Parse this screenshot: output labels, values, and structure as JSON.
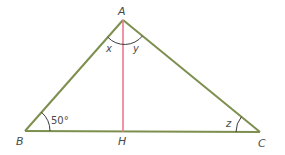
{
  "diagram": {
    "type": "triangle-with-altitude",
    "colors": {
      "triangle": "#7d8f4e",
      "altitude": "#e87a8c",
      "arc": "#3c3c3c",
      "label": "#4a4a4a"
    },
    "vertices": {
      "A": {
        "label": "A",
        "x": 123,
        "y": 20
      },
      "B": {
        "label": "B",
        "x": 25,
        "y": 131
      },
      "C": {
        "label": "C",
        "x": 260,
        "y": 132
      },
      "H": {
        "label": "H",
        "x": 123,
        "y": 132
      }
    },
    "angles": {
      "B": {
        "label": "50°"
      },
      "C": {
        "label": "z"
      },
      "A_left": {
        "label": "x"
      },
      "A_right": {
        "label": "y"
      }
    },
    "segments": [
      "AB",
      "AC",
      "BC",
      "AH"
    ]
  }
}
